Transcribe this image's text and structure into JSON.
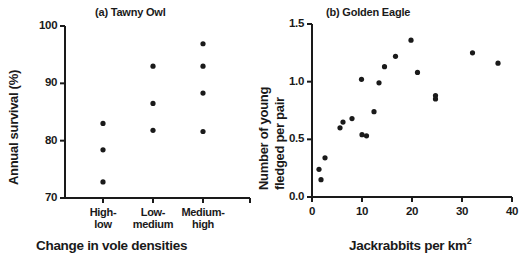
{
  "figure": {
    "panels": [
      {
        "id": "a",
        "title": "(a) Tawny Owl",
        "ylabel": "Annual survival (%)",
        "xlabel": "Change in vole densities"
      },
      {
        "id": "b",
        "title": "(b) Golden Eagle",
        "ylabel_line1": "Number of young",
        "ylabel_line2": "fledged per pair",
        "xlabel_pre": "Jackrabbits per km",
        "xlabel_sup": "2"
      }
    ]
  },
  "chart_data": [
    {
      "type": "scatter",
      "title": "(a) Tawny Owl",
      "xlabel": "Change in vole densities",
      "ylabel": "Annual survival (%)",
      "categorical_x": true,
      "categories": [
        "High-low",
        "Low-medium",
        "Medium-high"
      ],
      "category_labels_wrapped": [
        [
          "High-",
          "low"
        ],
        [
          "Low-",
          "medium"
        ],
        [
          "Medium-",
          "high"
        ]
      ],
      "ylim": [
        70,
        100
      ],
      "yticks": [
        70,
        80,
        90,
        100
      ],
      "ytick_labels": [
        "70",
        "80",
        "90",
        "100"
      ],
      "grid": false,
      "legend": false,
      "series": [
        {
          "name": "Annual survival",
          "points": [
            {
              "category": "High-low",
              "x": 1,
              "y": 83.0
            },
            {
              "category": "High-low",
              "x": 1,
              "y": 78.4
            },
            {
              "category": "High-low",
              "x": 1,
              "y": 72.8
            },
            {
              "category": "Low-medium",
              "x": 2,
              "y": 93.0
            },
            {
              "category": "Low-medium",
              "x": 2,
              "y": 86.5
            },
            {
              "category": "Low-medium",
              "x": 2,
              "y": 81.8
            },
            {
              "category": "Medium-high",
              "x": 3,
              "y": 96.9
            },
            {
              "category": "Medium-high",
              "x": 3,
              "y": 93.0
            },
            {
              "category": "Medium-high",
              "x": 3,
              "y": 88.3
            },
            {
              "category": "Medium-high",
              "x": 3,
              "y": 81.6
            }
          ]
        }
      ]
    },
    {
      "type": "scatter",
      "title": "(b) Golden Eagle",
      "xlabel": "Jackrabbits per km2",
      "ylabel": "Number of young fledged per pair",
      "xlim": [
        0,
        40
      ],
      "ylim": [
        0.0,
        1.5
      ],
      "xticks": [
        0,
        10,
        20,
        30,
        40
      ],
      "xtick_labels": [
        "0",
        "10",
        "20",
        "30",
        "40"
      ],
      "yticks": [
        0.0,
        0.5,
        1.0,
        1.5
      ],
      "ytick_labels": [
        "0.0",
        "0.5",
        "1.0",
        "1.5"
      ],
      "grid": false,
      "legend": false,
      "series": [
        {
          "name": "Young fledged per pair",
          "points": [
            {
              "x": 1.4,
              "y": 0.24
            },
            {
              "x": 1.8,
              "y": 0.15
            },
            {
              "x": 2.6,
              "y": 0.34
            },
            {
              "x": 5.6,
              "y": 0.6
            },
            {
              "x": 6.2,
              "y": 0.65
            },
            {
              "x": 8.0,
              "y": 0.68
            },
            {
              "x": 9.9,
              "y": 1.02
            },
            {
              "x": 10.0,
              "y": 0.54
            },
            {
              "x": 10.9,
              "y": 0.53
            },
            {
              "x": 12.4,
              "y": 0.74
            },
            {
              "x": 13.4,
              "y": 0.99
            },
            {
              "x": 14.5,
              "y": 1.13
            },
            {
              "x": 16.7,
              "y": 1.22
            },
            {
              "x": 19.8,
              "y": 1.36
            },
            {
              "x": 21.1,
              "y": 1.08
            },
            {
              "x": 24.7,
              "y": 0.88
            },
            {
              "x": 24.7,
              "y": 0.85
            },
            {
              "x": 32.1,
              "y": 1.25
            },
            {
              "x": 37.2,
              "y": 1.16
            }
          ]
        }
      ]
    }
  ],
  "style": {
    "axis_color": "#1a1a1a",
    "point_color": "#1a1a1a",
    "background": "#ffffff"
  }
}
